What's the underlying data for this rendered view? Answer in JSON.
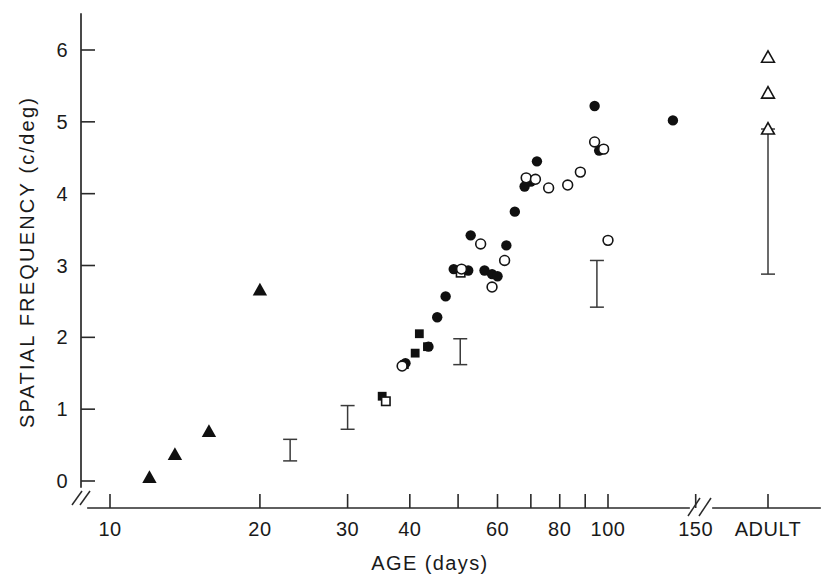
{
  "figure": {
    "width": 833,
    "height": 582,
    "background": "#ffffff",
    "ink_color": "#101010"
  },
  "chart_data": {
    "type": "scatter",
    "title": "",
    "xlabel": "AGE (days)",
    "ylabel": "SPATIAL FREQUENCY (c/deg)",
    "xscale": "log",
    "yscale": "linear",
    "grid": false,
    "legend": "none",
    "xlim": [
      10,
      160
    ],
    "ylim": [
      -0.35,
      6.5
    ],
    "x_tick_values": [
      10,
      20,
      30,
      40,
      50,
      60,
      70,
      80,
      90,
      100,
      150
    ],
    "x_tick_labels": [
      "10",
      "20",
      "30",
      "40",
      "",
      "60",
      "",
      "80",
      "",
      "100",
      "150"
    ],
    "x_category_tick": "ADULT",
    "y_tick_values": [
      0,
      1,
      2,
      3,
      4,
      5,
      6
    ],
    "y_tick_labels": [
      "0",
      "1",
      "2",
      "3",
      "4",
      "5",
      "6"
    ],
    "axis_break_x": true,
    "axis_break_y": true,
    "series": [
      {
        "name": "filled-triangle",
        "marker": "triangle-filled",
        "points": [
          {
            "x": 12.0,
            "y": 0.05
          },
          {
            "x": 13.5,
            "y": 0.37
          },
          {
            "x": 15.8,
            "y": 0.69
          },
          {
            "x": 20.0,
            "y": 2.66
          }
        ]
      },
      {
        "name": "filled-square",
        "marker": "square-filled",
        "points": [
          {
            "x": 35.2,
            "y": 1.18
          },
          {
            "x": 39.0,
            "y": 1.62
          },
          {
            "x": 41.0,
            "y": 1.78
          },
          {
            "x": 41.8,
            "y": 2.05
          },
          {
            "x": 43.4,
            "y": 1.87
          }
        ]
      },
      {
        "name": "open-square",
        "marker": "square-open",
        "points": [
          {
            "x": 35.8,
            "y": 1.11
          },
          {
            "x": 50.6,
            "y": 2.9
          }
        ]
      },
      {
        "name": "filled-circle",
        "marker": "circle-filled",
        "points": [
          {
            "x": 39.2,
            "y": 1.64
          },
          {
            "x": 43.6,
            "y": 1.87
          },
          {
            "x": 45.4,
            "y": 2.28
          },
          {
            "x": 47.2,
            "y": 2.57
          },
          {
            "x": 49.0,
            "y": 2.95
          },
          {
            "x": 52.4,
            "y": 2.93
          },
          {
            "x": 53.0,
            "y": 3.42
          },
          {
            "x": 56.5,
            "y": 2.93
          },
          {
            "x": 58.5,
            "y": 2.88
          },
          {
            "x": 60.0,
            "y": 2.85
          },
          {
            "x": 62.5,
            "y": 3.28
          },
          {
            "x": 65.0,
            "y": 3.75
          },
          {
            "x": 68.0,
            "y": 4.1
          },
          {
            "x": 70.0,
            "y": 4.17
          },
          {
            "x": 72.0,
            "y": 4.45
          },
          {
            "x": 94.0,
            "y": 5.22
          },
          {
            "x": 96.0,
            "y": 4.6
          },
          {
            "x": 98.0,
            "y": 4.62
          },
          {
            "x": 135.0,
            "y": 5.02
          }
        ]
      },
      {
        "name": "open-circle",
        "marker": "circle-open",
        "points": [
          {
            "x": 38.6,
            "y": 1.6
          },
          {
            "x": 50.8,
            "y": 2.95
          },
          {
            "x": 55.5,
            "y": 3.3
          },
          {
            "x": 58.5,
            "y": 2.7
          },
          {
            "x": 62.0,
            "y": 3.07
          },
          {
            "x": 68.5,
            "y": 4.22
          },
          {
            "x": 71.5,
            "y": 4.2
          },
          {
            "x": 76.0,
            "y": 4.08
          },
          {
            "x": 83.0,
            "y": 4.12
          },
          {
            "x": 88.0,
            "y": 4.3
          },
          {
            "x": 94.0,
            "y": 4.72
          },
          {
            "x": 98.0,
            "y": 4.62
          },
          {
            "x": 100.0,
            "y": 3.35
          }
        ]
      },
      {
        "name": "open-triangle-adult",
        "marker": "triangle-open",
        "points": [
          {
            "x": 155.0,
            "y": 5.9
          },
          {
            "x": 155.0,
            "y": 5.4
          },
          {
            "x": 155.0,
            "y": 4.9
          }
        ]
      }
    ],
    "error_bars": [
      {
        "x": 23.0,
        "low": 0.28,
        "high": 0.58,
        "center": 0.43
      },
      {
        "x": 30.0,
        "low": 0.72,
        "high": 1.05,
        "center": 0.88
      },
      {
        "x": 50.5,
        "low": 1.62,
        "high": 1.98,
        "center": 1.8
      },
      {
        "x": 95.0,
        "low": 2.42,
        "high": 3.07,
        "center": 2.75
      },
      {
        "x": 155.0,
        "low": 2.88,
        "high": 4.9,
        "center": 3.9
      }
    ]
  }
}
